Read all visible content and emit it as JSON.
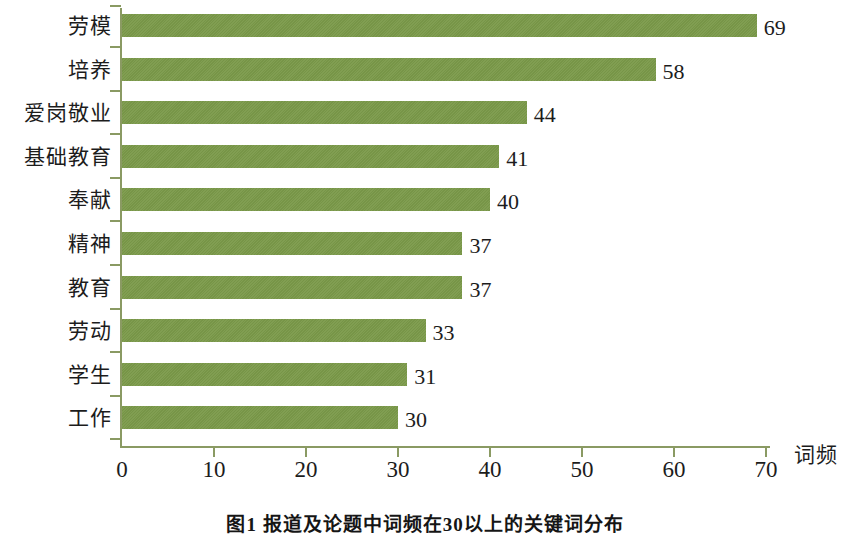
{
  "chart_data": {
    "type": "bar",
    "orientation": "horizontal",
    "title": "",
    "xlabel": "词频",
    "ylabel": "",
    "xlim": [
      0,
      72
    ],
    "xticks": [
      "0",
      "10",
      "20",
      "30",
      "40",
      "50",
      "60",
      "70"
    ],
    "xtick_values": [
      0,
      10,
      20,
      30,
      40,
      50,
      60,
      70
    ],
    "grid": false,
    "legend": false,
    "bar_color": "#7b9a4a",
    "axis_color": "#8a9a63",
    "text_color": "#1c1c1c",
    "background": "#ffffff",
    "categories": [
      "劳模",
      "培养",
      "爱岗敬业",
      "基础教育",
      "奉献",
      "精神",
      "教育",
      "劳动",
      "学生",
      "工作"
    ],
    "values": [
      69,
      58,
      44,
      41,
      40,
      37,
      37,
      33,
      31,
      30
    ],
    "value_labels": [
      "69",
      "58",
      "44",
      "41",
      "40",
      "37",
      "37",
      "33",
      "31",
      "30"
    ]
  },
  "caption": {
    "text": "图1  报道及论题中词频在30以上的关键词分布"
  }
}
